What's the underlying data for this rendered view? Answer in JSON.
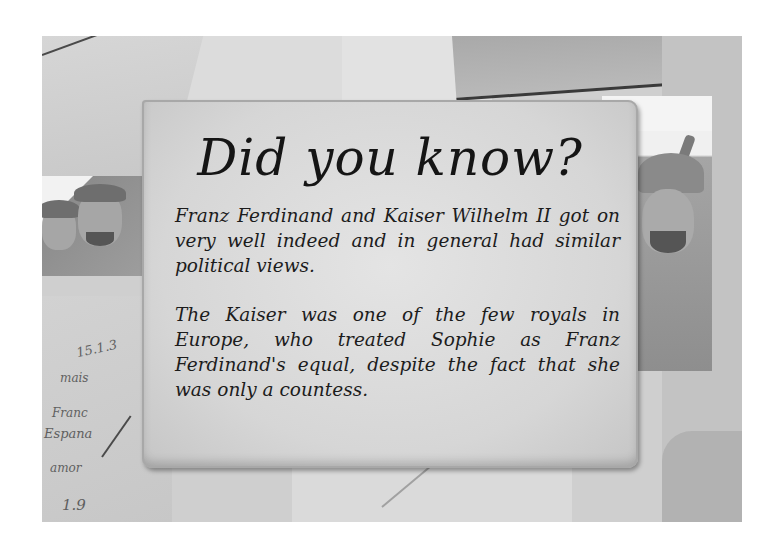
{
  "card": {
    "title": "Did you know?",
    "paragraphs": [
      "Franz Ferdinand and Kaiser Wilhelm II got on very well indeed and in general had similar political views.",
      "The Kaiser was one of the few royals in Europe, who treated Sophie as Franz Ferdinand's equal, despite the fact that she was only a countess."
    ]
  },
  "background": {
    "description": "Sepia/greyscale collage of old handwritten letters and WWI-era photographs",
    "photos": [
      {
        "position": "left",
        "subject": "two soldiers in caps"
      },
      {
        "position": "right",
        "subject": "soldier in spiked helmet smoking"
      }
    ],
    "handwriting": [
      "15.1.3",
      "mais",
      "Franc",
      "Espana",
      "amor",
      "1.9"
    ]
  },
  "colors": {
    "card": "#d8d8d8",
    "text": "#1a1a1a",
    "page": "#ffffff"
  }
}
